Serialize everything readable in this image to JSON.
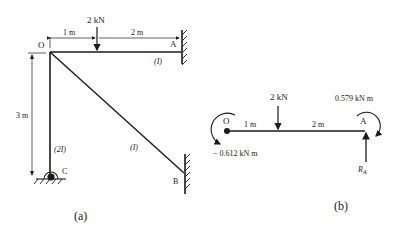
{
  "figure_a": {
    "caption": "(a)",
    "nodes": {
      "O": "O",
      "A": "A",
      "B": "B",
      "C": "C"
    },
    "load": "2 kN",
    "dim_left": "1 m",
    "dim_right": "2 m",
    "dim_vertical": "3 m",
    "member_OA": "(I)",
    "member_OB": "(I)",
    "member_OC": "(2I)"
  },
  "figure_b": {
    "caption": "(b)",
    "nodes": {
      "O": "O",
      "A": "A"
    },
    "load": "2 kN",
    "dim_left": "1 m",
    "dim_right": "2 m",
    "moment_A": "0.579 kN m",
    "moment_O": "− 0.612 kN m",
    "reaction_A": "R",
    "reaction_A_sub": "A"
  },
  "colors": {
    "ink": "#1a1a1a",
    "background": "#ffffff"
  }
}
